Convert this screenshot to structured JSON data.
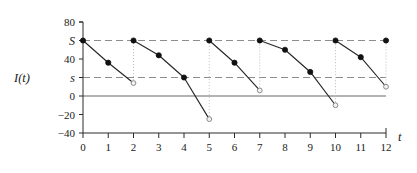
{
  "chart_data": {
    "type": "line",
    "title": "",
    "xlabel": "t",
    "ylabel": "I(t)",
    "xlim": [
      0,
      12
    ],
    "ylim": [
      -40,
      80
    ],
    "grid": false,
    "legend": null,
    "x_ticks": [
      "0",
      "1",
      "2",
      "3",
      "4",
      "5",
      "6",
      "7",
      "8",
      "9",
      "10",
      "11",
      "12"
    ],
    "x_tick_values": [
      0,
      1,
      2,
      3,
      4,
      5,
      6,
      7,
      8,
      9,
      10,
      11,
      12
    ],
    "y_ticks": [
      "80",
      "S",
      "40",
      "s",
      "0",
      "-20",
      "-40"
    ],
    "y_tick_values": [
      80,
      60,
      40,
      20,
      0,
      -20,
      -40
    ],
    "reference_lines": [
      {
        "label": "S",
        "value": 60,
        "style": "dashed"
      },
      {
        "label": "s",
        "value": 20,
        "style": "dashed"
      },
      {
        "label": "0",
        "value": 0,
        "style": "solid"
      }
    ],
    "series": [
      {
        "name": "cycle-1",
        "x": [
          0,
          1,
          2
        ],
        "values": [
          60,
          36,
          14
        ]
      },
      {
        "name": "cycle-2",
        "x": [
          2,
          3,
          4,
          5
        ],
        "values": [
          60,
          44,
          20,
          -25
        ]
      },
      {
        "name": "cycle-3",
        "x": [
          5,
          6,
          7
        ],
        "values": [
          60,
          36,
          6
        ]
      },
      {
        "name": "cycle-4",
        "x": [
          7,
          8,
          9,
          10
        ],
        "values": [
          60,
          50,
          26,
          -10
        ]
      },
      {
        "name": "cycle-5",
        "x": [
          10,
          11,
          12
        ],
        "values": [
          60,
          42,
          10
        ]
      }
    ],
    "reorder_drops": [
      {
        "x": 2,
        "from": 14,
        "to": 60
      },
      {
        "x": 5,
        "from": -25,
        "to": 60
      },
      {
        "x": 7,
        "from": 6,
        "to": 60
      },
      {
        "x": 10,
        "from": -10,
        "to": 60
      },
      {
        "x": 12,
        "from": 60,
        "to": 10
      }
    ],
    "filled_points": [
      {
        "x": 0,
        "y": 60
      },
      {
        "x": 1,
        "y": 36
      },
      {
        "x": 2,
        "y": 60
      },
      {
        "x": 3,
        "y": 44
      },
      {
        "x": 4,
        "y": 20
      },
      {
        "x": 5,
        "y": 60
      },
      {
        "x": 6,
        "y": 36
      },
      {
        "x": 7,
        "y": 60
      },
      {
        "x": 8,
        "y": 50
      },
      {
        "x": 9,
        "y": 26
      },
      {
        "x": 10,
        "y": 60
      },
      {
        "x": 11,
        "y": 42
      },
      {
        "x": 12,
        "y": 60
      }
    ],
    "open_points": [
      {
        "x": 2,
        "y": 14
      },
      {
        "x": 5,
        "y": -25
      },
      {
        "x": 7,
        "y": 6
      },
      {
        "x": 10,
        "y": -10
      },
      {
        "x": 12,
        "y": 10
      }
    ]
  }
}
